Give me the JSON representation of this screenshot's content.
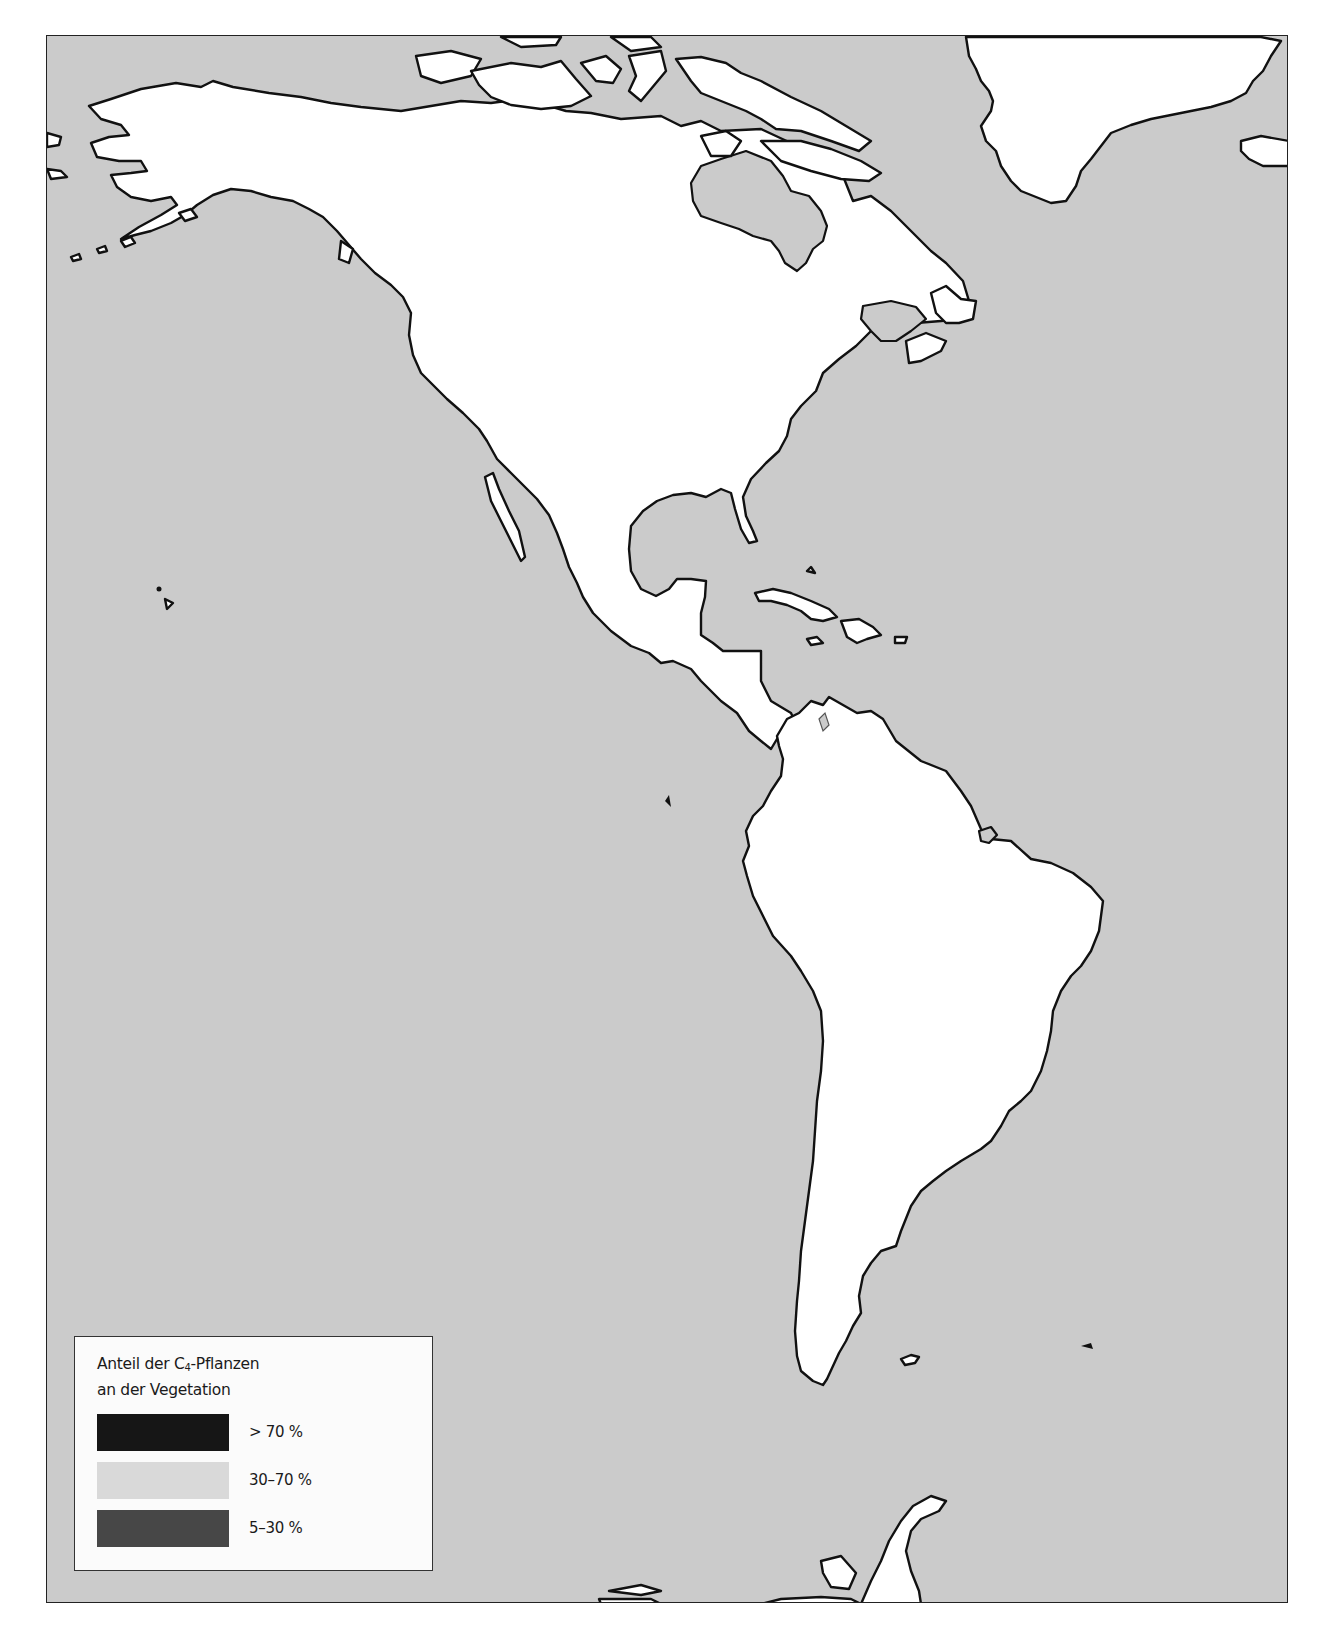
{
  "map": {
    "region": "Americas",
    "colors": {
      "ocean": "#cbcbcb",
      "land": "#ffffff",
      "coastline": "#111111",
      "frame": "#222222"
    }
  },
  "legend": {
    "title_line1_prefix": "Anteil der  C",
    "title_subscript": "4",
    "title_line1_suffix": "-Pflanzen",
    "title_line2": "an der Vegetation",
    "items": [
      {
        "label": "> 70 %",
        "color": "#161616"
      },
      {
        "label": "30–70 %",
        "color": "#d9d9d9"
      },
      {
        "label": "5–30 %",
        "color": "#474747"
      }
    ]
  }
}
